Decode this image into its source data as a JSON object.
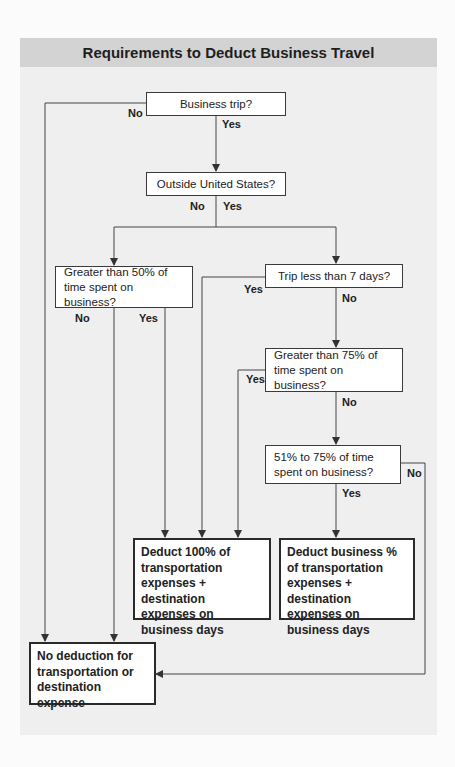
{
  "title": "Requirements to Deduct Business Travel",
  "colors": {
    "header_bg": "#d3d3d3",
    "panel_bg": "#efefef",
    "box_border": "#3a3a3a",
    "line": "#444444"
  },
  "nodes": {
    "business_trip": "Business trip?",
    "outside_us": "Outside United States?",
    "greater_50": "Greater than 50% of time spent on business?",
    "trip_less_7": "Trip less than 7 days?",
    "greater_75": "Greater than 75% of time spent on business?",
    "between_51_75": "51% to 75% of time spent on business?",
    "deduct_100": "Deduct 100% of transportation expenses + destination expenses on business days",
    "deduct_pct": "Deduct business % of transportation expenses + destination expenses on business days",
    "no_deduction": "No deduction for transportation or destination expense"
  },
  "labels": {
    "business_trip_no": "No",
    "business_trip_yes": "Yes",
    "outside_us_no": "No",
    "outside_us_yes": "Yes",
    "greater_50_no": "No",
    "greater_50_yes": "Yes",
    "trip_less_7_yes": "Yes",
    "trip_less_7_no": "No",
    "greater_75_yes": "Yes",
    "greater_75_no": "No",
    "between_51_75_no": "No",
    "between_51_75_yes": "Yes"
  }
}
